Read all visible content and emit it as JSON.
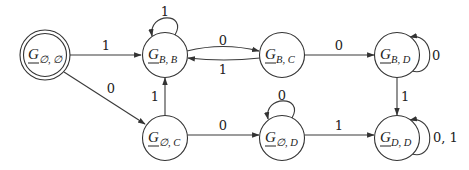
{
  "diagram": {
    "type": "finite-state-automaton",
    "colors": {
      "stroke": "#333333",
      "text": "#222222",
      "background": "#ffffff"
    },
    "nodes": [
      {
        "id": "G_empty_empty",
        "label": "G",
        "subscript": "∅, ∅",
        "accepting": true,
        "initial": false
      },
      {
        "id": "G_B_B",
        "label": "G",
        "subscript": "B, B",
        "accepting": false
      },
      {
        "id": "G_B_C",
        "label": "G",
        "subscript": "B, C",
        "accepting": false
      },
      {
        "id": "G_B_D",
        "label": "G",
        "subscript": "B, D",
        "accepting": false
      },
      {
        "id": "G_empty_C",
        "label": "G",
        "subscript": "∅, C",
        "accepting": false
      },
      {
        "id": "G_empty_D",
        "label": "G",
        "subscript": "∅, D",
        "accepting": false
      },
      {
        "id": "G_D_D",
        "label": "G",
        "subscript": "D, D",
        "accepting": false
      }
    ],
    "edges": [
      {
        "from": "G_empty_empty",
        "to": "G_B_B",
        "label": "1"
      },
      {
        "from": "G_empty_empty",
        "to": "G_empty_C",
        "label": "0"
      },
      {
        "from": "G_B_B",
        "to": "G_B_B",
        "label": "1"
      },
      {
        "from": "G_B_B",
        "to": "G_B_C",
        "label": "0"
      },
      {
        "from": "G_B_C",
        "to": "G_B_B",
        "label": "1"
      },
      {
        "from": "G_B_C",
        "to": "G_B_D",
        "label": "0"
      },
      {
        "from": "G_B_D",
        "to": "G_B_D",
        "label": "0"
      },
      {
        "from": "G_B_D",
        "to": "G_D_D",
        "label": "1"
      },
      {
        "from": "G_empty_C",
        "to": "G_B_B",
        "label": "1"
      },
      {
        "from": "G_empty_C",
        "to": "G_empty_D",
        "label": "0"
      },
      {
        "from": "G_empty_D",
        "to": "G_empty_D",
        "label": "0"
      },
      {
        "from": "G_empty_D",
        "to": "G_D_D",
        "label": "1"
      },
      {
        "from": "G_D_D",
        "to": "G_D_D",
        "label": "0, 1"
      }
    ]
  }
}
